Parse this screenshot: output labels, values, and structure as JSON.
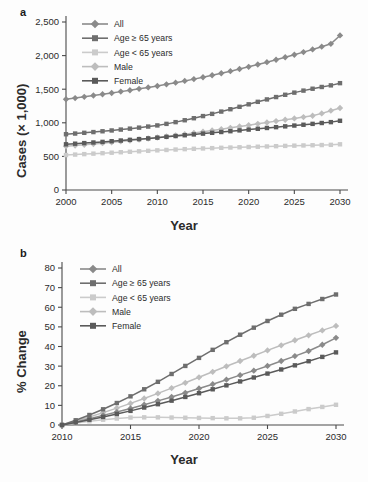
{
  "figure": {
    "background": "#fdfdfd",
    "panels": [
      {
        "label": "a",
        "xlabel": "Year",
        "ylabel": "Cases (× 1,000)"
      },
      {
        "label": "b",
        "xlabel": "Year",
        "ylabel": "% Change"
      }
    ]
  },
  "colors": {
    "all": "#8a8a8a",
    "age_ge_65": "#6e6e6e",
    "age_lt_65": "#cbcbcb",
    "male": "#bdbdbd",
    "female": "#5a5a5a",
    "axis": "#4a4a4a",
    "text": "#2b2b2b"
  },
  "chart_data": [
    {
      "type": "line",
      "panel": "a",
      "title": "",
      "xlabel": "Year",
      "ylabel": "Cases (× 1,000)",
      "xlim": [
        2000,
        2030
      ],
      "ylim": [
        0,
        2500
      ],
      "xticks": [
        2000,
        2005,
        2010,
        2015,
        2020,
        2025,
        2030
      ],
      "xticklabels": [
        "2000",
        "2005",
        "2010",
        "2015",
        "2020",
        "2025",
        "2030"
      ],
      "yticks": [
        0,
        500,
        1000,
        1500,
        2000,
        2500
      ],
      "yticklabels": [
        "0",
        "500",
        "1,000",
        "1,500",
        "2,000",
        "2,500"
      ],
      "grid": false,
      "legend_position": "upper left",
      "x": [
        2000,
        2001,
        2002,
        2003,
        2004,
        2005,
        2006,
        2007,
        2008,
        2009,
        2010,
        2011,
        2012,
        2013,
        2014,
        2015,
        2016,
        2017,
        2018,
        2019,
        2020,
        2021,
        2022,
        2023,
        2024,
        2025,
        2026,
        2027,
        2028,
        2029,
        2030
      ],
      "series": [
        {
          "name": "All",
          "marker": "diamond",
          "color": "#8a8a8a",
          "values": [
            1350,
            1368,
            1387,
            1406,
            1425,
            1444,
            1464,
            1484,
            1505,
            1526,
            1548,
            1572,
            1597,
            1623,
            1650,
            1678,
            1707,
            1737,
            1768,
            1800,
            1833,
            1867,
            1902,
            1938,
            1975,
            2013,
            2052,
            2092,
            2133,
            2175,
            2300
          ]
        },
        {
          "name": "Age ≥ 65 years",
          "marker": "square",
          "color": "#6e6e6e",
          "values": [
            830,
            840,
            851,
            862,
            874,
            886,
            899,
            913,
            928,
            944,
            961,
            984,
            1010,
            1038,
            1068,
            1100,
            1133,
            1167,
            1202,
            1238,
            1275,
            1312,
            1348,
            1383,
            1417,
            1449,
            1479,
            1507,
            1533,
            1557,
            1590
          ]
        },
        {
          "name": "Age < 65 years",
          "marker": "square",
          "color": "#cbcbcb",
          "values": [
            520,
            527,
            534,
            541,
            548,
            555,
            562,
            569,
            576,
            583,
            590,
            596,
            602,
            608,
            613,
            618,
            623,
            628,
            632,
            636,
            640,
            644,
            648,
            652,
            656,
            660,
            663,
            666,
            669,
            672,
            680
          ]
        },
        {
          "name": "Male",
          "marker": "diamond",
          "color": "#bdbdbd",
          "values": [
            650,
            661,
            673,
            685,
            697,
            710,
            723,
            737,
            751,
            766,
            781,
            797,
            814,
            831,
            849,
            867,
            886,
            905,
            925,
            945,
            965,
            985,
            1005,
            1025,
            1045,
            1065,
            1085,
            1105,
            1140,
            1180,
            1220
          ]
        },
        {
          "name": "Female",
          "marker": "square",
          "color": "#5a5a5a",
          "values": [
            680,
            689,
            698,
            707,
            716,
            726,
            736,
            746,
            757,
            768,
            779,
            791,
            803,
            815,
            827,
            839,
            851,
            863,
            875,
            887,
            899,
            911,
            923,
            935,
            947,
            959,
            971,
            984,
            997,
            1010,
            1030
          ]
        }
      ]
    },
    {
      "type": "line",
      "panel": "b",
      "title": "",
      "xlabel": "Year",
      "ylabel": "% Change",
      "xlim": [
        2010,
        2030
      ],
      "ylim": [
        0,
        80
      ],
      "xticks": [
        2010,
        2015,
        2020,
        2025,
        2030
      ],
      "xticklabels": [
        "2010",
        "2015",
        "2020",
        "2025",
        "2030"
      ],
      "yticks": [
        0,
        10,
        20,
        30,
        40,
        50,
        60,
        70,
        80
      ],
      "yticklabels": [
        "0",
        "10",
        "20",
        "30",
        "40",
        "50",
        "60",
        "70",
        "80"
      ],
      "grid": false,
      "legend_position": "upper left",
      "x": [
        2010,
        2011,
        2012,
        2013,
        2014,
        2015,
        2016,
        2017,
        2018,
        2019,
        2020,
        2021,
        2022,
        2023,
        2024,
        2025,
        2026,
        2027,
        2028,
        2029,
        2030
      ],
      "series": [
        {
          "name": "All",
          "marker": "diamond",
          "color": "#8a8a8a",
          "values": [
            0,
            1.6,
            3.2,
            4.9,
            6.6,
            8.4,
            10.3,
            12.3,
            14.3,
            16.4,
            18.6,
            20.8,
            23.1,
            25.4,
            27.7,
            30.1,
            32.6,
            35.1,
            37.7,
            40.9,
            44.4
          ]
        },
        {
          "name": "Age ≥ 65 years",
          "marker": "square",
          "color": "#6e6e6e",
          "values": [
            0,
            2.4,
            5.1,
            8.0,
            11.2,
            14.6,
            18.2,
            22.0,
            26.0,
            30.1,
            34.2,
            38.3,
            42.2,
            46.0,
            49.6,
            53.0,
            56.2,
            59.2,
            61.7,
            64.2,
            66.5
          ]
        },
        {
          "name": "Age < 65 years",
          "marker": "square",
          "color": "#cbcbcb",
          "values": [
            0,
            1.0,
            1.9,
            2.7,
            3.3,
            3.8,
            3.9,
            3.9,
            3.8,
            3.7,
            3.6,
            3.5,
            3.4,
            3.4,
            3.7,
            4.6,
            5.7,
            6.9,
            8.1,
            9.2,
            10.3
          ]
        },
        {
          "name": "Male",
          "marker": "diamond",
          "color": "#bdbdbd",
          "values": [
            0,
            2.0,
            4.1,
            6.3,
            8.6,
            11.0,
            13.5,
            16.1,
            18.8,
            21.5,
            24.3,
            27.1,
            29.9,
            32.6,
            35.3,
            38.0,
            40.6,
            43.2,
            45.7,
            48.2,
            50.5
          ]
        },
        {
          "name": "Female",
          "marker": "square",
          "color": "#5a5a5a",
          "values": [
            0,
            1.3,
            2.7,
            4.1,
            5.6,
            7.2,
            8.9,
            10.6,
            12.4,
            14.3,
            16.2,
            18.2,
            20.2,
            22.2,
            24.2,
            26.2,
            28.3,
            30.4,
            32.5,
            34.7,
            37.0
          ]
        }
      ]
    }
  ]
}
